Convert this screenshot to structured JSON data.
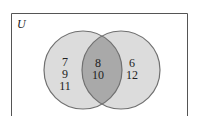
{
  "diagram": {
    "type": "venn",
    "universe_label": "U",
    "sets": [
      {
        "name": "left-set",
        "only_elements": [
          "7",
          "9",
          "11"
        ]
      },
      {
        "name": "right-set",
        "only_elements": [
          "6",
          "12"
        ]
      }
    ],
    "intersection": [
      "8",
      "10"
    ],
    "colors": {
      "circle_fill": "#dcdcdc",
      "intersection_fill": "#a9a9a9",
      "stroke": "#707070",
      "border": "#555555"
    }
  }
}
